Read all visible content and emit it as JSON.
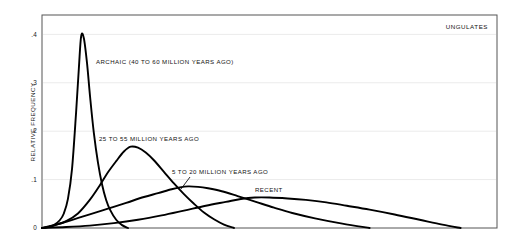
{
  "chart_data": {
    "type": "line",
    "title": "",
    "corner_label": "UNGULATES",
    "xlabel": "",
    "ylabel": "RELATIVE FREQUENCY",
    "ylim": [
      0,
      0.44
    ],
    "xlim": [
      0,
      1
    ],
    "grid": true,
    "grid_axis": "y",
    "legend_position": "inline-annotations",
    "y_ticks": [
      {
        "value": 0.4,
        "label": ".4"
      },
      {
        "value": 0.3,
        "label": ".3"
      },
      {
        "value": 0.2,
        "label": ".2"
      },
      {
        "value": 0.1,
        "label": ".1"
      },
      {
        "value": 0.0,
        "label": "0"
      }
    ],
    "x_ticks": [],
    "line_color": "#000000",
    "grid_color": "#ebebeb",
    "frame_color": "#555555",
    "series": [
      {
        "name": "ARCHAIC (40 TO 60 MILLION YEARS AGO)",
        "label": "ARCHAIC (40 TO 60 MILLION YEARS AGO)",
        "peak_x": 0.086,
        "peak_y": 0.4,
        "x": [
          0.0,
          0.013,
          0.026,
          0.039,
          0.048,
          0.057,
          0.066,
          0.075,
          0.081,
          0.086,
          0.092,
          0.099,
          0.106,
          0.114,
          0.123,
          0.132,
          0.141,
          0.15,
          0.163,
          0.176,
          0.189
        ],
        "values": [
          0.0,
          0.002,
          0.006,
          0.016,
          0.03,
          0.06,
          0.122,
          0.24,
          0.33,
          0.396,
          0.392,
          0.34,
          0.268,
          0.196,
          0.135,
          0.09,
          0.058,
          0.037,
          0.017,
          0.006,
          0.0
        ]
      },
      {
        "name": "25 TO 55 MILLION YEARS AGO",
        "label": "25 TO 55 MILLION YEARS AGO",
        "peak_x": 0.195,
        "peak_y": 0.168,
        "x": [
          0.0,
          0.026,
          0.053,
          0.079,
          0.105,
          0.127,
          0.145,
          0.163,
          0.18,
          0.195,
          0.211,
          0.228,
          0.246,
          0.268,
          0.29,
          0.312,
          0.334,
          0.356,
          0.378,
          0.4,
          0.422
        ],
        "values": [
          0.0,
          0.005,
          0.014,
          0.03,
          0.058,
          0.088,
          0.115,
          0.138,
          0.158,
          0.168,
          0.166,
          0.156,
          0.14,
          0.116,
          0.092,
          0.07,
          0.05,
          0.032,
          0.018,
          0.007,
          0.0
        ]
      },
      {
        "name": "5 TO 20 MILLION YEARS AGO",
        "label": "5 TO 20 MILLION YEARS AGO",
        "peak_x": 0.321,
        "peak_y": 0.086,
        "x": [
          0.0,
          0.035,
          0.07,
          0.105,
          0.145,
          0.185,
          0.224,
          0.255,
          0.285,
          0.303,
          0.321,
          0.343,
          0.365,
          0.395,
          0.43,
          0.47,
          0.51,
          0.55,
          0.6,
          0.66,
          0.72
        ],
        "values": [
          0.0,
          0.008,
          0.018,
          0.028,
          0.04,
          0.052,
          0.064,
          0.072,
          0.08,
          0.084,
          0.086,
          0.085,
          0.082,
          0.076,
          0.066,
          0.054,
          0.042,
          0.031,
          0.02,
          0.009,
          0.0
        ]
      },
      {
        "name": "RECENT",
        "label": "RECENT",
        "peak_x": 0.468,
        "peak_y": 0.063,
        "x": [
          0.0,
          0.053,
          0.105,
          0.158,
          0.211,
          0.263,
          0.312,
          0.36,
          0.404,
          0.437,
          0.468,
          0.5,
          0.54,
          0.58,
          0.625,
          0.67,
          0.72,
          0.775,
          0.83,
          0.88,
          0.92
        ],
        "values": [
          0.0,
          0.002,
          0.005,
          0.01,
          0.017,
          0.026,
          0.036,
          0.046,
          0.054,
          0.06,
          0.063,
          0.063,
          0.061,
          0.058,
          0.053,
          0.046,
          0.038,
          0.028,
          0.017,
          0.007,
          0.0
        ]
      }
    ],
    "annotations": [
      {
        "name": "archaic-label",
        "text": "ARCHAIC (40 TO 60 MILLION YEARS AGO)",
        "x": 96,
        "y": 64,
        "anchor": "start",
        "leader": null
      },
      {
        "name": "mid-label",
        "text": "25 TO 55 MILLION YEARS AGO",
        "x": 99,
        "y": 141,
        "anchor": "start",
        "leader": null
      },
      {
        "name": "late-label",
        "text": "5 TO 20 MILLION YEARS AGO",
        "x": 172,
        "y": 174,
        "anchor": "start",
        "leader": {
          "x1": 181,
          "y1": 189,
          "x2": 190,
          "y2": 177
        }
      },
      {
        "name": "recent-label",
        "text": "RECENT",
        "x": 255,
        "y": 192,
        "anchor": "start",
        "leader": null
      }
    ]
  },
  "plot_geometry": {
    "frame_left": 42,
    "frame_top": 15,
    "frame_right": 497,
    "frame_bottom": 228
  }
}
